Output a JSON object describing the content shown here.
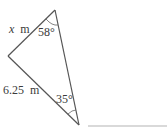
{
  "diagram": {
    "type": "triangle",
    "vertices": [
      "top",
      "left",
      "bottom"
    ],
    "side_labels": {
      "top_left": {
        "variable": "x",
        "unit": "m"
      },
      "left_bottom": {
        "value": "6.25",
        "unit": "m"
      }
    },
    "angles": {
      "top": "58°",
      "bottom": "35°"
    },
    "colors": {
      "stroke": "#555555",
      "text": "#3a3a3a",
      "rule": "#cccccc"
    }
  }
}
